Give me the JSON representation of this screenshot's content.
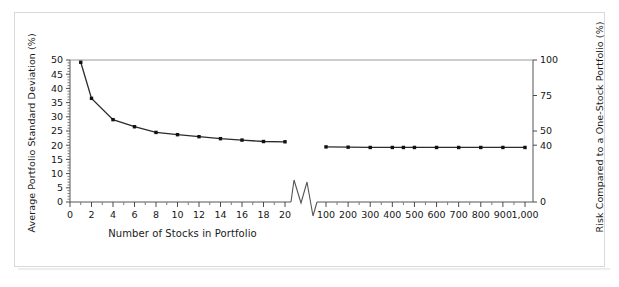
{
  "figure": {
    "background_color": "#ffffff",
    "frame_color": "#d9d9d9",
    "series_color": "#2b2b2b"
  },
  "chart_data": {
    "type": "line",
    "title": "",
    "xlabel": "Number of Stocks in Portfolio",
    "ylabel": "Average Portfolio Standard Deviation (%)",
    "y2label": "Risk Compared to a One-Stock Portfolio (%)",
    "grid": false,
    "legend": null,
    "axis_break": true,
    "axis_break_note": "x-axis broken between 20 and 100 stocks",
    "ylim": [
      0,
      50
    ],
    "y2lim": [
      0,
      100
    ],
    "yticks": [
      0,
      5,
      10,
      15,
      20,
      25,
      30,
      35,
      40,
      45,
      50
    ],
    "ytick_labels": [
      "0",
      "5",
      "10",
      "15",
      "20",
      "25",
      "30",
      "35",
      "40",
      "45",
      "50"
    ],
    "y2ticks": [
      0,
      40,
      50,
      75,
      100
    ],
    "y2tick_labels": [
      "0",
      "40",
      "50",
      "75",
      "100"
    ],
    "xticks_left": [
      0,
      2,
      4,
      6,
      8,
      10,
      12,
      14,
      16,
      18,
      20
    ],
    "xtick_labels_left": [
      "0",
      "2",
      "4",
      "6",
      "8",
      "10",
      "12",
      "14",
      "16",
      "18",
      "20"
    ],
    "xticks_right": [
      100,
      200,
      300,
      400,
      500,
      600,
      700,
      800,
      900,
      1000
    ],
    "xtick_labels_right": [
      "100",
      "200",
      "300",
      "400",
      "500",
      "600",
      "700",
      "800",
      "900",
      "1,000"
    ],
    "series": [
      {
        "name": "Average portfolio standard deviation (segment 1)",
        "segment": "left",
        "x": [
          1,
          2,
          4,
          6,
          8,
          10,
          12,
          14,
          16,
          18,
          20
        ],
        "values": [
          49.2,
          36.5,
          29.0,
          26.5,
          24.5,
          23.7,
          23.0,
          22.3,
          21.8,
          21.3,
          21.2
        ]
      },
      {
        "name": "Average portfolio standard deviation (segment 2)",
        "segment": "right",
        "x": [
          100,
          200,
          300,
          400,
          450,
          500,
          600,
          700,
          800,
          900,
          1000
        ],
        "values": [
          19.4,
          19.3,
          19.2,
          19.2,
          19.2,
          19.2,
          19.2,
          19.2,
          19.2,
          19.2,
          19.2
        ]
      }
    ]
  }
}
